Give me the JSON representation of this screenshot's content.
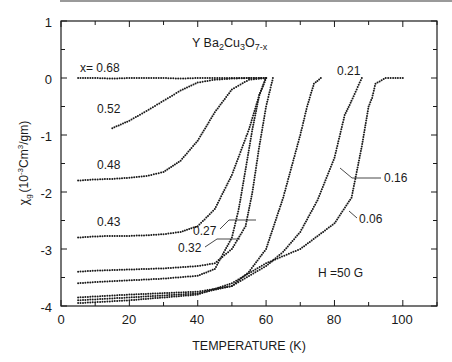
{
  "chart_data": {
    "type": "scatter",
    "title": "Y Ba2Cu3O7-x",
    "title_parts": {
      "base": "Y Ba",
      "s1": "2",
      "m1": "Cu",
      "s2": "3",
      "m2": "O",
      "s3": "7-x"
    },
    "xlabel": "TEMPERATURE (K)",
    "ylabel": "χg (10⁻³Cm³/gm)",
    "ylabel_parts": {
      "chi": "χ",
      "sub": "g",
      "pre": "(10",
      "exp1": "-3",
      "mid": "Cm",
      "exp2": "3",
      "post": "/gm)"
    },
    "xlim": [
      0,
      110
    ],
    "ylim": [
      -4,
      1
    ],
    "xticks": [
      0,
      20,
      40,
      60,
      80,
      100
    ],
    "xtick_labels": [
      "0",
      "20",
      "40",
      "60",
      "80",
      "100"
    ],
    "yticks": [
      1,
      0,
      -1,
      -2,
      -3,
      -4
    ],
    "ytick_labels": [
      "1",
      "0",
      "-1",
      "-2",
      "-3",
      "-4"
    ],
    "grid": false,
    "annotation": "H =50 G",
    "series": [
      {
        "name": "x = 0.68",
        "label": "x= 0.68",
        "x": [
          5,
          10,
          15,
          20,
          25,
          30,
          35,
          40,
          45,
          50,
          55,
          60
        ],
        "y": [
          0,
          0,
          -0.01,
          0,
          0,
          0,
          -0.01,
          0,
          0,
          0,
          0,
          0
        ]
      },
      {
        "name": "0.52",
        "label": "0.52",
        "x": [
          15,
          20,
          25,
          30,
          35,
          40,
          45,
          50,
          55,
          60
        ],
        "y": [
          -0.88,
          -0.75,
          -0.58,
          -0.4,
          -0.22,
          -0.08,
          -0.03,
          -0.01,
          0,
          0
        ]
      },
      {
        "name": "0.48",
        "label": "0.48",
        "x": [
          5,
          10,
          15,
          20,
          25,
          30,
          35,
          40,
          45,
          50,
          55,
          60
        ],
        "y": [
          -1.8,
          -1.78,
          -1.77,
          -1.75,
          -1.72,
          -1.65,
          -1.45,
          -1.1,
          -0.6,
          -0.2,
          -0.03,
          0
        ]
      },
      {
        "name": "0.43",
        "label": "0.43",
        "x": [
          5,
          10,
          15,
          20,
          25,
          30,
          35,
          40,
          45,
          50,
          55,
          58,
          60
        ],
        "y": [
          -2.8,
          -2.78,
          -2.77,
          -2.77,
          -2.76,
          -2.74,
          -2.7,
          -2.6,
          -2.3,
          -1.7,
          -0.9,
          -0.3,
          0
        ]
      },
      {
        "name": "0.32",
        "label": "0.32",
        "x": [
          5,
          10,
          20,
          30,
          40,
          45,
          50,
          52,
          54,
          56,
          58,
          60
        ],
        "y": [
          -3.6,
          -3.58,
          -3.55,
          -3.52,
          -3.47,
          -3.35,
          -2.8,
          -2.3,
          -1.6,
          -0.9,
          -0.3,
          0
        ]
      },
      {
        "name": "0.27",
        "label": "0.27",
        "x": [
          5,
          10,
          20,
          30,
          40,
          45,
          50,
          54,
          56,
          58,
          60,
          62
        ],
        "y": [
          -3.4,
          -3.38,
          -3.36,
          -3.34,
          -3.3,
          -3.25,
          -3.0,
          -2.6,
          -2.0,
          -1.2,
          -0.5,
          0
        ]
      },
      {
        "name": "0.21",
        "label": "0.21",
        "x": [
          5,
          20,
          40,
          50,
          55,
          60,
          65,
          70,
          72,
          74,
          76
        ],
        "y": [
          -3.85,
          -3.8,
          -3.75,
          -3.65,
          -3.4,
          -3.0,
          -2.1,
          -1.0,
          -0.5,
          -0.1,
          0
        ]
      },
      {
        "name": "0.16",
        "label": "0.16",
        "x": [
          5,
          20,
          40,
          50,
          60,
          65,
          70,
          75,
          80,
          83,
          85,
          88
        ],
        "y": [
          -3.9,
          -3.85,
          -3.78,
          -3.65,
          -3.3,
          -3.05,
          -2.7,
          -2.15,
          -1.4,
          -0.65,
          -0.4,
          0
        ]
      },
      {
        "name": "0.06",
        "label": "0.06",
        "x": [
          5,
          20,
          40,
          50,
          60,
          70,
          80,
          85,
          88,
          90,
          91,
          92,
          95,
          100
        ],
        "y": [
          -3.95,
          -3.9,
          -3.8,
          -3.6,
          -3.25,
          -3.0,
          -2.55,
          -2.1,
          -1.2,
          -0.5,
          -0.35,
          -0.1,
          0,
          0
        ]
      }
    ]
  }
}
